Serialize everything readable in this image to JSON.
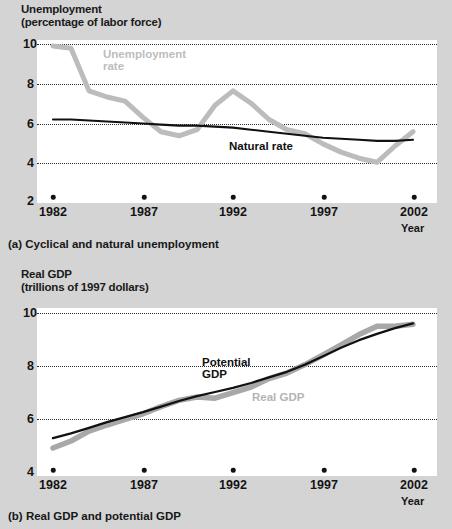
{
  "figure": {
    "background_color": "#d4d4d4",
    "plot_background_color": "#ffffff",
    "series_colors": {
      "actual_gray": "#bcbcbc",
      "trend_black": "#111111",
      "gridline": "#2b2b2b"
    }
  },
  "panel_a": {
    "axis_title_line1": "Unemployment",
    "axis_title_line2": "(percentage of labor force)",
    "xaxis_name": "Year",
    "caption": "(a) Cyclical and natural unemployment",
    "label_unemployment_line1": "Unemployment",
    "label_unemployment_line2": "rate",
    "label_natural": "Natural rate",
    "yticks": [
      "10",
      "8",
      "6",
      "4",
      "2"
    ],
    "xticks": [
      "1982",
      "1987",
      "1992",
      "1997",
      "2002"
    ]
  },
  "panel_b": {
    "axis_title_line1": "Real GDP",
    "axis_title_line2": "(trillions of 1997 dollars)",
    "xaxis_name": "Year",
    "caption": "(b) Real GDP and potential GDP",
    "label_potential_line1": "Potential",
    "label_potential_line2": "GDP",
    "label_real": "Real GDP",
    "yticks": [
      "10",
      "8",
      "6",
      "4"
    ],
    "xticks": [
      "1982",
      "1987",
      "1992",
      "1997",
      "2002"
    ]
  },
  "chart_data": [
    {
      "type": "line",
      "title": "Cyclical and natural unemployment",
      "xlabel": "Year",
      "ylabel": "Unemployment (percentage of labor force)",
      "xlim": [
        1982,
        2002
      ],
      "ylim": [
        2,
        10
      ],
      "yticks": [
        2,
        4,
        6,
        8,
        10
      ],
      "xticks": [
        1982,
        1987,
        1992,
        1997,
        2002
      ],
      "grid": "horizontal-dotted",
      "legend": "inline-annotations",
      "x": [
        1982,
        1983,
        1984,
        1985,
        1986,
        1987,
        1988,
        1989,
        1990,
        1991,
        1992,
        1993,
        1994,
        1995,
        1996,
        1997,
        1998,
        1999,
        2000,
        2001,
        2002
      ],
      "series": [
        {
          "name": "Unemployment rate",
          "color": "#bcbcbc",
          "values": [
            9.7,
            9.6,
            7.5,
            7.2,
            7.0,
            6.2,
            5.5,
            5.3,
            5.6,
            6.8,
            7.5,
            6.9,
            6.1,
            5.6,
            5.4,
            4.9,
            4.5,
            4.2,
            4.0,
            4.8,
            5.5
          ]
        },
        {
          "name": "Natural rate",
          "color": "#111111",
          "values": [
            6.1,
            6.1,
            6.05,
            6.0,
            5.95,
            5.9,
            5.85,
            5.8,
            5.8,
            5.75,
            5.7,
            5.6,
            5.5,
            5.4,
            5.3,
            5.2,
            5.15,
            5.1,
            5.05,
            5.05,
            5.1
          ]
        }
      ],
      "annotations": [
        {
          "text": "Unemployment rate",
          "x": 1984.2,
          "y": 9.0
        },
        {
          "text": "Natural rate",
          "x": 1993.2,
          "y": 4.9
        }
      ]
    },
    {
      "type": "line",
      "title": "Real GDP and potential GDP",
      "xlabel": "Year",
      "ylabel": "Real GDP (trillions of 1997 dollars)",
      "xlim": [
        1982,
        2002
      ],
      "ylim": [
        4,
        10
      ],
      "yticks": [
        4,
        6,
        8,
        10
      ],
      "xticks": [
        1982,
        1987,
        1992,
        1997,
        2002
      ],
      "grid": "horizontal-dotted",
      "legend": "inline-annotations",
      "x": [
        1982,
        1983,
        1984,
        1985,
        1986,
        1987,
        1988,
        1989,
        1990,
        1991,
        1992,
        1993,
        1994,
        1995,
        1996,
        1997,
        1998,
        1999,
        2000,
        2001,
        2002
      ],
      "series": [
        {
          "name": "Real GDP",
          "color": "#a8a8a8",
          "values": [
            5.0,
            5.25,
            5.6,
            5.82,
            6.02,
            6.22,
            6.48,
            6.7,
            6.82,
            6.78,
            6.98,
            7.18,
            7.48,
            7.68,
            7.98,
            8.32,
            8.68,
            9.05,
            9.35,
            9.35,
            9.42
          ]
        },
        {
          "name": "Potential GDP",
          "color": "#111111",
          "values": [
            5.35,
            5.52,
            5.72,
            5.92,
            6.1,
            6.28,
            6.48,
            6.68,
            6.85,
            7.0,
            7.15,
            7.32,
            7.52,
            7.72,
            7.98,
            8.28,
            8.58,
            8.85,
            9.08,
            9.28,
            9.45
          ]
        }
      ],
      "annotations": [
        {
          "text": "Potential GDP",
          "x": 1992.0,
          "y": 7.7
        },
        {
          "text": "Real GDP",
          "x": 1994.5,
          "y": 6.9
        }
      ]
    }
  ]
}
